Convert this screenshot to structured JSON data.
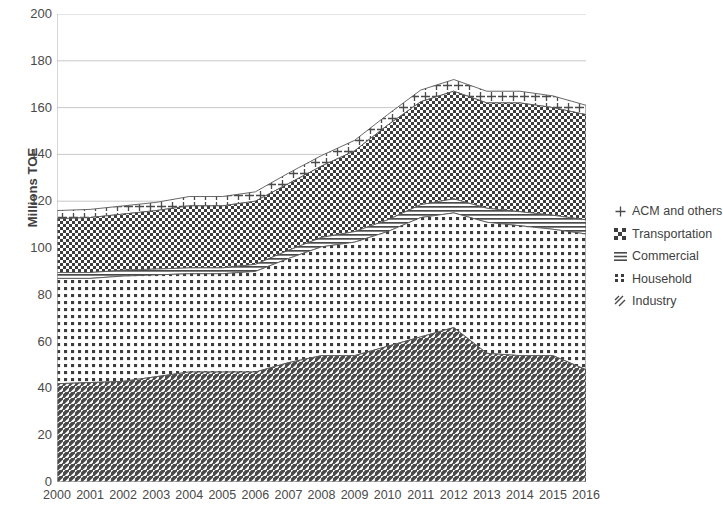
{
  "chart_data": {
    "type": "area",
    "stacked": true,
    "title": "",
    "subtitle": "",
    "xlabel": "",
    "ylabel": "Millions TOE",
    "categories": [
      "2000",
      "2001",
      "2002",
      "2003",
      "2004",
      "2005",
      "2006",
      "2007",
      "2008",
      "2009",
      "2010",
      "2011",
      "2012",
      "2013",
      "2014",
      "2015",
      "2016"
    ],
    "ylim": [
      0,
      200
    ],
    "ytick_labels": [
      "0",
      "20",
      "40",
      "60",
      "80",
      "100",
      "120",
      "140",
      "160",
      "180",
      "200"
    ],
    "ytick_values": [
      0,
      20,
      40,
      60,
      80,
      100,
      120,
      140,
      160,
      180,
      200
    ],
    "grid": true,
    "grid_axis": "y",
    "legend_position": "right",
    "legend_order_top_to_bottom": [
      "ACM and others",
      "Transportation",
      "Commercial",
      "Household",
      "Industry"
    ],
    "series": [
      {
        "name": "Industry",
        "pattern": "diagonal-hatch",
        "stack_order": 1,
        "values": [
          42,
          42.5,
          43,
          45,
          47,
          47,
          47,
          51,
          54,
          54,
          58,
          62,
          66,
          55,
          54,
          54,
          48
        ]
      },
      {
        "name": "Household",
        "pattern": "dotted-grid",
        "stack_order": 2,
        "values": [
          45,
          44.5,
          45,
          43.5,
          42,
          42,
          43,
          44.5,
          46.5,
          48.5,
          49,
          51,
          49,
          56,
          55.5,
          54,
          58
        ]
      },
      {
        "name": "Commercial",
        "pattern": "horizontal-lines",
        "stack_order": 3,
        "values": [
          2.5,
          2.5,
          2.5,
          2.5,
          2.5,
          2.5,
          3,
          3.5,
          4,
          4.5,
          5,
          5.5,
          6,
          6,
          6,
          6,
          6
        ]
      },
      {
        "name": "Transportation",
        "pattern": "checker-grid",
        "stack_order": 4,
        "values": [
          23,
          23.5,
          24,
          25,
          26.5,
          26.5,
          27,
          28.5,
          30.5,
          34.5,
          40.5,
          44,
          46,
          45,
          46.5,
          46,
          45
        ]
      },
      {
        "name": "ACM and others",
        "pattern": "plus-marks",
        "stack_order": 5,
        "values": [
          3.5,
          3.5,
          3.5,
          3.5,
          4,
          4,
          4,
          4.5,
          4.5,
          4.5,
          4.5,
          5,
          5,
          5,
          5,
          5,
          4
        ]
      }
    ],
    "totals": [
      116,
      116.5,
      118,
      119.5,
      122,
      122,
      124,
      132,
      139.5,
      146,
      157,
      167.5,
      172,
      167,
      167,
      165,
      161
    ]
  },
  "legend": {
    "items": [
      {
        "label": "ACM and others",
        "key": "plus-icon"
      },
      {
        "label": "Transportation",
        "key": "checker-icon"
      },
      {
        "label": "Commercial",
        "key": "horizontal-lines-icon"
      },
      {
        "label": "Household",
        "key": "dotted-grid-icon"
      },
      {
        "label": "Industry",
        "key": "diagonal-hatch-icon"
      }
    ]
  },
  "colors": {
    "ink": "#3a3a3a",
    "grid": "#c9c9c9",
    "axis": "#b0b0b0",
    "background": "#ffffff"
  }
}
